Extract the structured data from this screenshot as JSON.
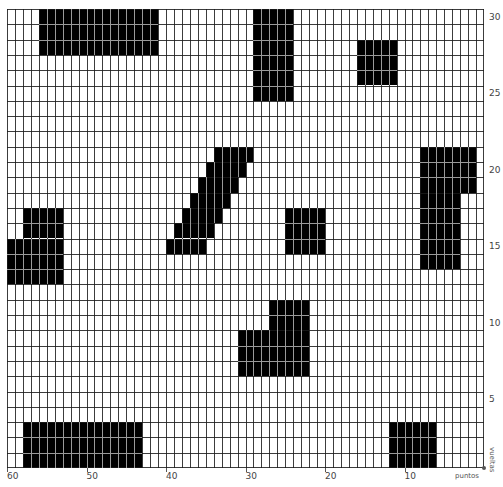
{
  "chart": {
    "type": "knitting-chart",
    "columns": 60,
    "rows": 30,
    "colors": {
      "filled": "#000000",
      "empty": "#ffffff",
      "grid": "#1a1a1a"
    },
    "column_labels": [
      {
        "value": "60",
        "stitch": 60
      },
      {
        "value": "50",
        "stitch": 50
      },
      {
        "value": "40",
        "stitch": 40
      },
      {
        "value": "30",
        "stitch": 30
      },
      {
        "value": "20",
        "stitch": 20
      },
      {
        "value": "10",
        "stitch": 10
      }
    ],
    "row_labels": [
      {
        "value": "5",
        "row": 5
      },
      {
        "value": "10",
        "row": 10
      },
      {
        "value": "15",
        "row": 15
      },
      {
        "value": "20",
        "row": 20
      },
      {
        "value": "25",
        "row": 25
      },
      {
        "value": "30",
        "row": 30
      }
    ],
    "x_axis_title": "puntos",
    "y_axis_title": "vueltas",
    "filled_blocks": [
      {
        "col_start": 4,
        "col_end": 18,
        "row_start": 0,
        "row_end": 2
      },
      {
        "col_start": 31,
        "col_end": 35,
        "row_start": 0,
        "row_end": 5
      },
      {
        "col_start": 44,
        "col_end": 48,
        "row_start": 2,
        "row_end": 4
      },
      {
        "col_start": 26,
        "col_end": 30,
        "row_start": 9,
        "row_end": 9
      },
      {
        "col_start": 25,
        "col_end": 29,
        "row_start": 10,
        "row_end": 10
      },
      {
        "col_start": 24,
        "col_end": 28,
        "row_start": 11,
        "row_end": 11
      },
      {
        "col_start": 23,
        "col_end": 27,
        "row_start": 12,
        "row_end": 12
      },
      {
        "col_start": 22,
        "col_end": 26,
        "row_start": 13,
        "row_end": 13
      },
      {
        "col_start": 21,
        "col_end": 25,
        "row_start": 14,
        "row_end": 14
      },
      {
        "col_start": 20,
        "col_end": 24,
        "row_start": 15,
        "row_end": 15
      },
      {
        "col_start": 52,
        "col_end": 58,
        "row_start": 9,
        "row_end": 11
      },
      {
        "col_start": 52,
        "col_end": 56,
        "row_start": 12,
        "row_end": 16
      },
      {
        "col_start": 2,
        "col_end": 6,
        "row_start": 13,
        "row_end": 14
      },
      {
        "col_start": 0,
        "col_end": 6,
        "row_start": 15,
        "row_end": 17
      },
      {
        "col_start": 35,
        "col_end": 39,
        "row_start": 13,
        "row_end": 15
      },
      {
        "col_start": 33,
        "col_end": 37,
        "row_start": 19,
        "row_end": 20
      },
      {
        "col_start": 29,
        "col_end": 37,
        "row_start": 21,
        "row_end": 23
      },
      {
        "col_start": 2,
        "col_end": 16,
        "row_start": 27,
        "row_end": 29
      },
      {
        "col_start": 48,
        "col_end": 53,
        "row_start": 27,
        "row_end": 29
      }
    ]
  }
}
